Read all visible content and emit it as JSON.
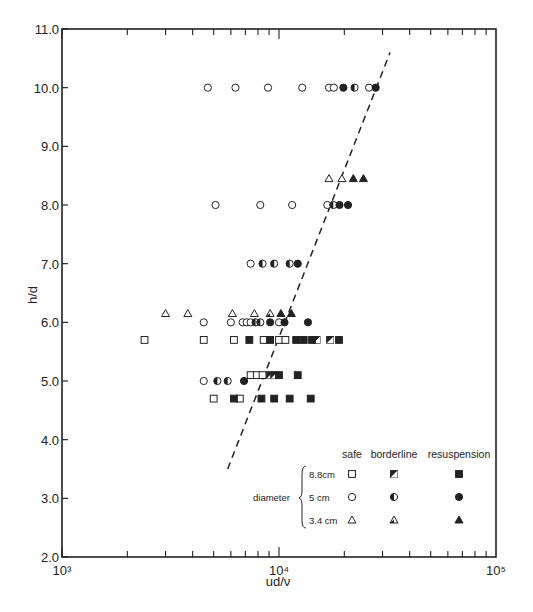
{
  "chart_data": {
    "type": "scatter",
    "title": "",
    "xlabel": "ud/ν",
    "ylabel": "h/d",
    "xscale": "log",
    "xlim": [
      1000,
      100000
    ],
    "ylim": [
      2.0,
      11.0
    ],
    "x_tick_labels": [
      "10³",
      "10⁴",
      "10⁵"
    ],
    "y_tick_labels": [
      "2.0",
      "3.0",
      "4.0",
      "5.0",
      "6.0",
      "7.0",
      "8.0",
      "9.0",
      "10.0",
      "11.0"
    ],
    "grid": false,
    "legend": {
      "position": "lower right",
      "group_label": "diameter",
      "columns": [
        "safe",
        "borderline",
        "resuspension"
      ],
      "rows": [
        {
          "label": "8.8cm",
          "marker": "square"
        },
        {
          "label": "5 cm",
          "marker": "circle"
        },
        {
          "label": "3.4 cm",
          "marker": "triangle"
        }
      ]
    },
    "threshold_line": {
      "style": "dashed",
      "points": [
        [
          5800,
          3.5
        ],
        [
          32500,
          10.6
        ]
      ]
    },
    "series": [
      {
        "name": "8.8cm safe",
        "marker": "square",
        "fill": "open",
        "points": [
          [
            2400,
            5.7
          ],
          [
            4500,
            5.7
          ],
          [
            6200,
            5.7
          ],
          [
            8500,
            5.7
          ],
          [
            10000,
            5.7
          ],
          [
            10700,
            5.7
          ],
          [
            5000,
            4.7
          ],
          [
            6600,
            4.7
          ],
          [
            7400,
            5.1
          ],
          [
            7900,
            5.1
          ],
          [
            8400,
            5.1
          ]
        ]
      },
      {
        "name": "8.8cm borderline",
        "marker": "square",
        "fill": "half",
        "points": [
          [
            14900,
            5.7
          ],
          [
            17200,
            5.7
          ],
          [
            9100,
            5.1
          ],
          [
            9500,
            5.1
          ]
        ]
      },
      {
        "name": "8.8cm resuspension",
        "marker": "square",
        "fill": "filled",
        "points": [
          [
            7300,
            5.7
          ],
          [
            9100,
            5.7
          ],
          [
            12000,
            5.7
          ],
          [
            13000,
            5.7
          ],
          [
            14200,
            5.7
          ],
          [
            18900,
            5.7
          ],
          [
            10000,
            5.1
          ],
          [
            12200,
            5.1
          ],
          [
            6200,
            4.7
          ],
          [
            8300,
            4.7
          ],
          [
            9500,
            4.7
          ],
          [
            11200,
            4.7
          ],
          [
            14000,
            4.7
          ]
        ]
      },
      {
        "name": "5cm safe",
        "marker": "circle",
        "fill": "open",
        "points": [
          [
            4700,
            10.0
          ],
          [
            6300,
            10.0
          ],
          [
            8900,
            10.0
          ],
          [
            12800,
            10.0
          ],
          [
            17000,
            10.0
          ],
          [
            17900,
            10.0
          ],
          [
            26000,
            10.0
          ],
          [
            5100,
            8.0
          ],
          [
            8200,
            8.0
          ],
          [
            11500,
            8.0
          ],
          [
            16700,
            8.0
          ],
          [
            7400,
            7.0
          ],
          [
            4500,
            6.0
          ],
          [
            6000,
            6.0
          ],
          [
            6800,
            6.0
          ],
          [
            7100,
            6.0
          ],
          [
            7400,
            6.0
          ],
          [
            10000,
            6.0
          ],
          [
            4500,
            5.0
          ]
        ]
      },
      {
        "name": "5cm borderline",
        "marker": "circle",
        "fill": "half",
        "points": [
          [
            22300,
            10.0
          ],
          [
            17800,
            8.0
          ],
          [
            8400,
            7.0
          ],
          [
            9500,
            7.0
          ],
          [
            11200,
            7.0
          ],
          [
            7800,
            6.0
          ],
          [
            8200,
            6.0
          ],
          [
            5200,
            5.0
          ],
          [
            5800,
            5.0
          ]
        ]
      },
      {
        "name": "5cm resuspension",
        "marker": "circle",
        "fill": "filled",
        "points": [
          [
            19800,
            10.0
          ],
          [
            27900,
            10.0
          ],
          [
            19000,
            8.0
          ],
          [
            20800,
            8.0
          ],
          [
            12200,
            7.0
          ],
          [
            9100,
            6.0
          ],
          [
            10600,
            6.0
          ],
          [
            13600,
            6.0
          ],
          [
            6900,
            5.0
          ]
        ]
      },
      {
        "name": "3.4cm safe",
        "marker": "triangle",
        "fill": "open",
        "points": [
          [
            3000,
            6.15
          ],
          [
            3800,
            6.15
          ],
          [
            6100,
            6.15
          ],
          [
            7700,
            6.15
          ],
          [
            17000,
            8.45
          ],
          [
            19500,
            8.45
          ]
        ]
      },
      {
        "name": "3.4cm borderline",
        "marker": "triangle",
        "fill": "half",
        "points": [
          [
            9100,
            6.15
          ]
        ]
      },
      {
        "name": "3.4cm resuspension",
        "marker": "triangle",
        "fill": "filled",
        "points": [
          [
            10200,
            6.15
          ],
          [
            11400,
            6.15
          ],
          [
            22000,
            8.45
          ],
          [
            24500,
            8.45
          ]
        ]
      }
    ]
  }
}
